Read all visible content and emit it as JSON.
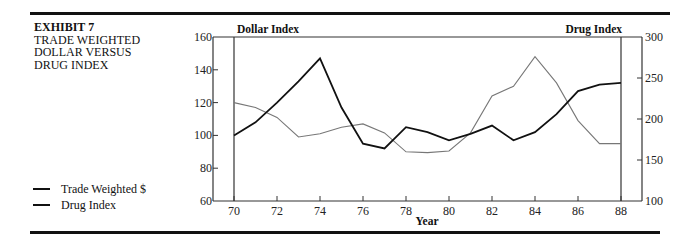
{
  "exhibit": {
    "number": "EXHIBIT 7",
    "title_lines": [
      "TRADE WEIGHTED",
      "DOLLAR VERSUS",
      "DRUG INDEX"
    ]
  },
  "legend": [
    {
      "label": "Trade Weighted $",
      "color": "#111111"
    },
    {
      "label": "Drug Index",
      "color": "#111111"
    }
  ],
  "chart_data": {
    "type": "line",
    "title": "Trade Weighted Dollar Versus Drug Index",
    "xlabel": "Year",
    "ylabel_left": "Dollar Index",
    "ylabel_right": "Drug Index",
    "x": [
      70,
      71,
      72,
      73,
      74,
      75,
      76,
      77,
      78,
      79,
      80,
      81,
      82,
      83,
      84,
      85,
      86,
      87,
      88
    ],
    "x_ticks": [
      "70",
      "72",
      "74",
      "76",
      "78",
      "80",
      "82",
      "84",
      "86",
      "88"
    ],
    "y_left_ticks": [
      "60",
      "80",
      "100",
      "120",
      "140",
      "160"
    ],
    "y_right_ticks": [
      "100",
      "150",
      "200",
      "250",
      "300"
    ],
    "ylim_left": [
      60,
      160
    ],
    "ylim_right": [
      100,
      300
    ],
    "grid": false,
    "legend_position": "left",
    "series": [
      {
        "name": "Trade Weighted $",
        "axis": "left",
        "color": "#111111",
        "values": [
          100,
          108,
          120,
          133,
          147,
          117,
          95,
          92,
          105,
          102,
          97,
          101,
          106,
          97,
          102,
          113,
          127,
          131,
          132
        ]
      },
      {
        "name": "Drug Index",
        "axis": "right",
        "color": "#777777",
        "values": [
          220,
          214,
          202,
          178,
          182,
          190,
          194,
          183,
          160,
          159,
          161,
          183,
          228,
          240,
          276,
          244,
          198,
          170,
          170
        ]
      }
    ]
  }
}
